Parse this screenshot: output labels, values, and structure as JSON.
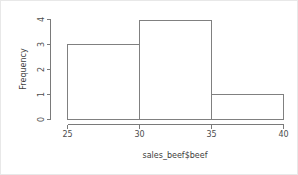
{
  "chart_data": {
    "type": "bar",
    "title": "",
    "subtitle": "",
    "xlabel": "sales_beef$beef",
    "ylabel": "Frequency",
    "categories": [
      "25-30",
      "30-35",
      "35-40"
    ],
    "bin_edges": [
      25,
      30,
      35,
      40
    ],
    "values": [
      3,
      4,
      1
    ],
    "series": [
      {
        "name": "Frequency",
        "values": [
          3,
          4,
          1
        ]
      }
    ],
    "xlim": [
      25,
      40
    ],
    "ylim": [
      0,
      4
    ],
    "xticks": [
      "25",
      "30",
      "35",
      "40"
    ],
    "xtick_values": [
      25,
      30,
      35,
      40
    ],
    "yticks": [
      "0",
      "1",
      "2",
      "3",
      "4"
    ],
    "ytick_values": [
      0,
      1,
      2,
      3,
      4
    ],
    "grid": false,
    "legend": false,
    "legend_position": "none",
    "bar_fill_color": "#ffffff",
    "bar_edge_color": "#808080",
    "axis_color": "#7a7a7a",
    "background_color": "#ffffff"
  },
  "axes": {
    "x_title": "sales_beef$beef",
    "y_title": "Frequency",
    "x_tick_labels": [
      "25",
      "30",
      "35",
      "40"
    ],
    "y_tick_labels": [
      "0",
      "1",
      "2",
      "3",
      "4"
    ]
  }
}
